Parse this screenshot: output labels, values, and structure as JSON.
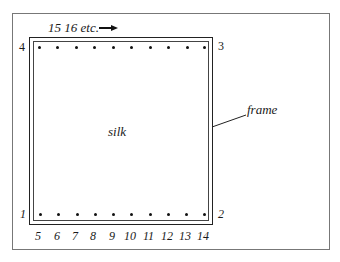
{
  "diagram": {
    "top_caption": "15 16 etc.",
    "arrow": "right-arrow",
    "center_label": "silk",
    "pointer_label": "frame",
    "corners": {
      "top_left": "4",
      "top_right": "3",
      "bottom_left": "1",
      "bottom_right": "2"
    },
    "bottom_numbers": [
      "5",
      "6",
      "7",
      "8",
      "9",
      "10",
      "11",
      "12",
      "13",
      "14"
    ],
    "top_pins_count": 10,
    "bottom_pins_count": 10
  }
}
